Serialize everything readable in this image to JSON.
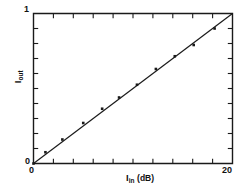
{
  "chart_data": {
    "type": "scatter",
    "title": "",
    "subtitle": "",
    "xlabel": "I_in (dB)",
    "ylabel": "I_out",
    "xlabel_base": "I",
    "xlabel_sub": "in",
    "xlabel_unit": "(dB)",
    "ylabel_base": "I",
    "ylabel_sub": "out",
    "xlim": [
      0,
      20
    ],
    "ylim": [
      0,
      1
    ],
    "xticks": [
      0,
      2,
      4,
      6,
      8,
      10,
      12,
      14,
      16,
      18,
      20
    ],
    "yticks": [
      0,
      0.1,
      0.2,
      0.3,
      0.4,
      0.5,
      0.6,
      0.7,
      0.8,
      0.9,
      1
    ],
    "xtick_labels": [
      "0",
      "20"
    ],
    "ytick_labels": [
      "0",
      "1"
    ],
    "xtick_label_values": [
      0,
      20
    ],
    "ytick_label_values": [
      0,
      1
    ],
    "grid": false,
    "legend": false,
    "legend_position": "none",
    "marker": "square",
    "marker_color": "#1a1a1a",
    "line_color": "#1a1a1a",
    "axis_color": "#1a1a1a",
    "background_color": "#ffffff",
    "x": [
      0.0,
      1.2,
      2.9,
      5.0,
      6.9,
      8.6,
      10.4,
      12.3,
      14.2,
      16.1,
      18.2
    ],
    "values": [
      0.0,
      0.075,
      0.16,
      0.27,
      0.365,
      0.44,
      0.525,
      0.63,
      0.715,
      0.79,
      0.9
    ],
    "series": [
      {
        "name": "measured",
        "type": "scatter",
        "x": [
          0.0,
          1.2,
          2.9,
          5.0,
          6.9,
          8.6,
          10.4,
          12.3,
          14.2,
          16.1,
          18.2
        ],
        "values": [
          0.0,
          0.075,
          0.16,
          0.27,
          0.365,
          0.44,
          0.525,
          0.63,
          0.715,
          0.79,
          0.9
        ]
      },
      {
        "name": "linear-fit",
        "type": "line",
        "x": [
          0,
          20
        ],
        "values": [
          0,
          1
        ]
      }
    ],
    "fit": {
      "slope": 0.05,
      "intercept": 0.0,
      "x_start": 0,
      "y_start": 0,
      "x_end": 20,
      "y_end": 1
    },
    "annotations": []
  },
  "labels": {
    "y_top": "1",
    "y_bottom": "0",
    "x_left": "0",
    "x_right": "20"
  }
}
